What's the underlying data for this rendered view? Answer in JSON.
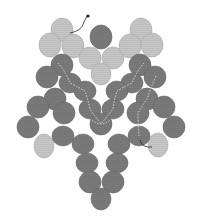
{
  "diagram": {
    "title": "",
    "type": "beadwork-pattern",
    "colors": {
      "background": "#ffffff",
      "dark_bead": "#7a7a7a",
      "dark_bead_stroke": "#666666",
      "light_bead": "#c6c6c6",
      "light_bead_stroke": "#a8a8a8",
      "thread_path": "#e6e6e6",
      "thread_tail": "#222222"
    },
    "beads": [
      {
        "id": "tl-top",
        "cx": 62,
        "cy": 30,
        "rx": 11,
        "ry": 12,
        "tone": "light"
      },
      {
        "id": "tl-left",
        "cx": 50,
        "cy": 45,
        "rx": 11,
        "ry": 12,
        "tone": "light"
      },
      {
        "id": "tl-right",
        "cx": 73,
        "cy": 46,
        "rx": 11,
        "ry": 12,
        "tone": "light"
      },
      {
        "id": "c-top",
        "cx": 101,
        "cy": 37,
        "rx": 11,
        "ry": 12,
        "tone": "dark"
      },
      {
        "id": "c-left",
        "cx": 90,
        "cy": 58,
        "rx": 11,
        "ry": 11,
        "tone": "light"
      },
      {
        "id": "c-right",
        "cx": 113,
        "cy": 58,
        "rx": 11,
        "ry": 11,
        "tone": "light"
      },
      {
        "id": "c-bottom",
        "cx": 101,
        "cy": 74,
        "rx": 10,
        "ry": 11,
        "tone": "light"
      },
      {
        "id": "tr-top",
        "cx": 141,
        "cy": 30,
        "rx": 11,
        "ry": 12,
        "tone": "light"
      },
      {
        "id": "tr-left",
        "cx": 130,
        "cy": 46,
        "rx": 11,
        "ry": 12,
        "tone": "light"
      },
      {
        "id": "tr-right",
        "cx": 152,
        "cy": 45,
        "rx": 11,
        "ry": 12,
        "tone": "light"
      },
      {
        "id": "l1",
        "cx": 62,
        "cy": 65,
        "rx": 11,
        "ry": 11,
        "tone": "dark"
      },
      {
        "id": "l2",
        "cx": 47,
        "cy": 77,
        "rx": 11,
        "ry": 11,
        "tone": "dark"
      },
      {
        "id": "l3",
        "cx": 70,
        "cy": 83,
        "rx": 11,
        "ry": 10,
        "tone": "dark"
      },
      {
        "id": "l4",
        "cx": 85,
        "cy": 91,
        "rx": 11,
        "ry": 10,
        "tone": "dark"
      },
      {
        "id": "l5",
        "cx": 55,
        "cy": 99,
        "rx": 11,
        "ry": 11,
        "tone": "dark"
      },
      {
        "id": "l6",
        "cx": 38,
        "cy": 107,
        "rx": 11,
        "ry": 11,
        "tone": "dark"
      },
      {
        "id": "l7",
        "cx": 64,
        "cy": 113,
        "rx": 11,
        "ry": 11,
        "tone": "dark"
      },
      {
        "id": "l8",
        "cx": 28,
        "cy": 127,
        "rx": 11,
        "ry": 11,
        "tone": "dark"
      },
      {
        "id": "l9",
        "cx": 44,
        "cy": 146,
        "rx": 10,
        "ry": 12,
        "tone": "light"
      },
      {
        "id": "l10",
        "cx": 63,
        "cy": 136,
        "rx": 11,
        "ry": 10,
        "tone": "dark"
      },
      {
        "id": "m1",
        "cx": 90,
        "cy": 109,
        "rx": 11,
        "ry": 10,
        "tone": "dark"
      },
      {
        "id": "m2",
        "cx": 113,
        "cy": 109,
        "rx": 11,
        "ry": 10,
        "tone": "dark"
      },
      {
        "id": "m3",
        "cx": 101,
        "cy": 124,
        "rx": 11,
        "ry": 11,
        "tone": "dark"
      },
      {
        "id": "m4",
        "cx": 83,
        "cy": 144,
        "rx": 11,
        "ry": 10,
        "tone": "dark"
      },
      {
        "id": "m5",
        "cx": 119,
        "cy": 144,
        "rx": 11,
        "ry": 10,
        "tone": "dark"
      },
      {
        "id": "r1",
        "cx": 140,
        "cy": 65,
        "rx": 11,
        "ry": 11,
        "tone": "dark"
      },
      {
        "id": "r2",
        "cx": 155,
        "cy": 77,
        "rx": 11,
        "ry": 11,
        "tone": "dark"
      },
      {
        "id": "r3",
        "cx": 132,
        "cy": 83,
        "rx": 11,
        "ry": 10,
        "tone": "dark"
      },
      {
        "id": "r4",
        "cx": 117,
        "cy": 91,
        "rx": 11,
        "ry": 10,
        "tone": "dark"
      },
      {
        "id": "r5",
        "cx": 147,
        "cy": 99,
        "rx": 11,
        "ry": 11,
        "tone": "dark"
      },
      {
        "id": "r6",
        "cx": 164,
        "cy": 107,
        "rx": 11,
        "ry": 11,
        "tone": "dark"
      },
      {
        "id": "r7",
        "cx": 138,
        "cy": 113,
        "rx": 11,
        "ry": 11,
        "tone": "dark"
      },
      {
        "id": "r8",
        "cx": 174,
        "cy": 127,
        "rx": 11,
        "ry": 11,
        "tone": "dark"
      },
      {
        "id": "r9",
        "cx": 158,
        "cy": 145,
        "rx": 10,
        "ry": 12,
        "tone": "light"
      },
      {
        "id": "r10",
        "cx": 139,
        "cy": 136,
        "rx": 11,
        "ry": 10,
        "tone": "dark"
      },
      {
        "id": "b1",
        "cx": 87,
        "cy": 163,
        "rx": 11,
        "ry": 10,
        "tone": "dark"
      },
      {
        "id": "b2",
        "cx": 117,
        "cy": 163,
        "rx": 11,
        "ry": 10,
        "tone": "dark"
      },
      {
        "id": "b3",
        "cx": 90,
        "cy": 182,
        "rx": 11,
        "ry": 11,
        "tone": "dark"
      },
      {
        "id": "b4",
        "cx": 113,
        "cy": 182,
        "rx": 11,
        "ry": 11,
        "tone": "dark"
      },
      {
        "id": "b5",
        "cx": 101,
        "cy": 199,
        "rx": 10,
        "ry": 11,
        "tone": "dark"
      }
    ],
    "thread_paths": [
      "M58 63 Q66 72 70 83 Q80 88 85 91 Q88 100 90 109 Q96 118 101 124",
      "M144 63 Q136 72 132 83 Q122 88 117 91 Q114 100 113 109 Q106 118 101 124",
      "M156 76 Q150 90 147 99 Q142 106 138 113 Q138 125 139 136",
      "M92 120 Q101 128 110 120"
    ],
    "thread_tail": {
      "start_path": "M70 33 Q82 31 84 22 L87 16",
      "end_path": "M140 140 Q142 148 152 147",
      "knot": {
        "cx": 88,
        "cy": 16,
        "r": 1.6
      }
    }
  }
}
